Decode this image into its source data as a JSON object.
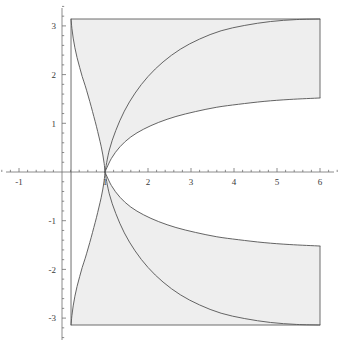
{
  "figure": {
    "name": "parametric-region-plot",
    "background": "#ffffff",
    "shade_color": "#eeeeee",
    "curve_color": "#5c5c5c",
    "axis_color": "#6e6e6e",
    "width": 340,
    "height": 348
  },
  "chart_data": {
    "type": "line",
    "title": "",
    "xlabel": "",
    "ylabel": "",
    "xlim": [
      -1.45,
      6.5
    ],
    "ylim": [
      -3.6,
      3.6
    ],
    "grid": false,
    "legend": null,
    "x_ticks_major": [
      -1,
      1,
      2,
      3,
      4,
      5,
      6
    ],
    "x_tick_labels": [
      "-1",
      "1",
      "2",
      "3",
      "4",
      "5",
      "6"
    ],
    "y_ticks_major": [
      -3,
      -2,
      -1,
      1,
      2,
      3
    ],
    "y_tick_labels": [
      "-3",
      "-2",
      "-1",
      "1",
      "2",
      "3"
    ],
    "minor_ticks_per_unit": 5,
    "region_box": {
      "x_min": 0.21,
      "x_max": 6.0,
      "y_min": -3.14159,
      "y_max": 3.14159
    },
    "series": [
      {
        "name": "upper-outer-curve",
        "comment": "steep branch rising from (1,0) to (0.21, 3.1416) on the left, shown as arc",
        "points": [
          [
            0.21,
            3.1416
          ],
          [
            0.23,
            2.95
          ],
          [
            0.26,
            2.75
          ],
          [
            0.3,
            2.55
          ],
          [
            0.35,
            2.35
          ],
          [
            0.41,
            2.15
          ],
          [
            0.47,
            1.96
          ],
          [
            0.54,
            1.77
          ],
          [
            0.61,
            1.56
          ],
          [
            0.68,
            1.34
          ],
          [
            0.74,
            1.14
          ],
          [
            0.8,
            0.94
          ],
          [
            0.86,
            0.72
          ],
          [
            0.91,
            0.53
          ],
          [
            0.95,
            0.35
          ],
          [
            0.98,
            0.18
          ],
          [
            1.0,
            0.0
          ]
        ]
      },
      {
        "name": "upper-inner-curve",
        "comment": "shallow branch from (1,0) rising to y = pi near x = 6",
        "points": [
          [
            1.0,
            0.0
          ],
          [
            1.1,
            0.45
          ],
          [
            1.25,
            0.85
          ],
          [
            1.45,
            1.25
          ],
          [
            1.7,
            1.62
          ],
          [
            2.0,
            1.96
          ],
          [
            2.35,
            2.26
          ],
          [
            2.75,
            2.52
          ],
          [
            3.2,
            2.73
          ],
          [
            3.7,
            2.9
          ],
          [
            4.25,
            3.01
          ],
          [
            4.85,
            3.09
          ],
          [
            5.45,
            3.13
          ],
          [
            6.0,
            3.1416
          ]
        ]
      },
      {
        "name": "upper-middle-curve",
        "comment": "branch from (1,0) flattening toward y = 1.52 at x = 6",
        "points": [
          [
            1.0,
            0.0
          ],
          [
            1.15,
            0.28
          ],
          [
            1.35,
            0.52
          ],
          [
            1.6,
            0.72
          ],
          [
            1.9,
            0.88
          ],
          [
            2.25,
            1.02
          ],
          [
            2.65,
            1.14
          ],
          [
            3.1,
            1.24
          ],
          [
            3.6,
            1.33
          ],
          [
            4.1,
            1.39
          ],
          [
            4.7,
            1.45
          ],
          [
            5.3,
            1.49
          ],
          [
            6.0,
            1.52
          ]
        ]
      },
      {
        "name": "lower-outer-curve",
        "comment": "mirror of upper-outer-curve about the x-axis",
        "points": [
          [
            0.21,
            -3.1416
          ],
          [
            0.23,
            -2.95
          ],
          [
            0.26,
            -2.75
          ],
          [
            0.3,
            -2.55
          ],
          [
            0.35,
            -2.35
          ],
          [
            0.41,
            -2.15
          ],
          [
            0.47,
            -1.96
          ],
          [
            0.54,
            -1.77
          ],
          [
            0.61,
            -1.56
          ],
          [
            0.68,
            -1.34
          ],
          [
            0.74,
            -1.14
          ],
          [
            0.8,
            -0.94
          ],
          [
            0.86,
            -0.72
          ],
          [
            0.91,
            -0.53
          ],
          [
            0.95,
            -0.35
          ],
          [
            0.98,
            -0.18
          ],
          [
            1.0,
            0.0
          ]
        ]
      },
      {
        "name": "lower-inner-curve",
        "comment": "mirror of upper-inner-curve about the x-axis",
        "points": [
          [
            1.0,
            0.0
          ],
          [
            1.1,
            -0.45
          ],
          [
            1.25,
            -0.85
          ],
          [
            1.45,
            -1.25
          ],
          [
            1.7,
            -1.62
          ],
          [
            2.0,
            -1.96
          ],
          [
            2.35,
            -2.26
          ],
          [
            2.75,
            -2.52
          ],
          [
            3.2,
            -2.73
          ],
          [
            3.7,
            -2.9
          ],
          [
            4.25,
            -3.01
          ],
          [
            4.85,
            -3.09
          ],
          [
            5.45,
            -3.13
          ],
          [
            6.0,
            -3.1416
          ]
        ]
      },
      {
        "name": "lower-middle-curve",
        "comment": "mirror of upper-middle-curve about the x-axis",
        "points": [
          [
            1.0,
            0.0
          ],
          [
            1.15,
            -0.28
          ],
          [
            1.35,
            -0.52
          ],
          [
            1.6,
            -0.72
          ],
          [
            1.9,
            -0.88
          ],
          [
            2.25,
            -1.02
          ],
          [
            2.65,
            -1.14
          ],
          [
            3.1,
            -1.24
          ],
          [
            3.6,
            -1.33
          ],
          [
            4.1,
            -1.39
          ],
          [
            4.7,
            -1.45
          ],
          [
            5.3,
            -1.49
          ],
          [
            6.0,
            -1.52
          ]
        ]
      }
    ],
    "shaded_regions": [
      {
        "name": "upper-shaded-region",
        "description": "region bounded above by y = pi, left by the outer branch, below by the middle branch, right by x = 6"
      },
      {
        "name": "lower-shaded-region",
        "description": "mirror image of the upper shaded region below the x-axis"
      }
    ]
  }
}
